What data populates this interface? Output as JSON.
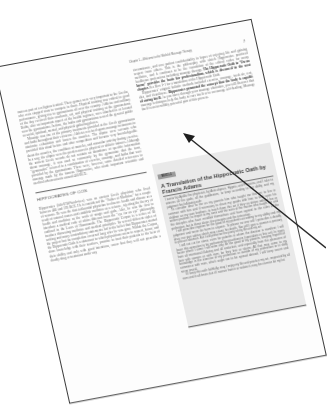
{
  "running_head": {
    "text": "Chapter 1—Welcome to the World of Massage Therapy",
    "page_number": "7"
  },
  "left_column": {
    "paragraphs": [
      "mass as part of a religious festival. These games were very important to the Greeks, who even stopped wars to compete in them. Physical training was critical to good performance, giving rise to gymnasiums all over the country. Athletes and military of the day received their academic, art, and physical training at the gymnasiums. Baths, also an important aspect of the health regimen, were attached to or located near the gymnasiums. In time, the baths and gymnasiums served the general public as social, spiritual, mental, and physical gathering places.",
      "Massage was one of the primary treatments provided at the Greek gymnasiums and baths throughout their existence. Athletes received sports massage treatments to minimize exhaustion and loosen the muscles. The aliptae were servants who provided this ritual before and after competition and became very knowledgeable about the muscles, the condition of muscles, and muscular activity during exercise. In a way, the aliptae were the predecessors to physical or athletic trainers. Although the ancient Greek records do not contain an abundance of specific information about massage, it was used so commonly by the gymnastae that the term, \"gymnastics\" referred to a combination of exercise, massage, and baths that were provided by the gymnasiums. There were, however, some detailed references to massage made by the famous Hippocrates, who made important scientific and medical advancements around 400 BCE."
    ],
    "bold_term": "gymnastics"
  },
  "section": {
    "heading": "HIPPOCRATES OF COS",
    "paragraph": "Hippocrates (hih-PAW-kruh-teez) was an ancient Greek physician who lived between 460 and 370 BCE. He is considered the \"Father of Medicine\" for a couple of reasons. He was the first influential physician to observe health and disease as a result of natural causes and establish medicine as a science, rejecting the theory of health and medicine as the work of magic and gods. Also, he was the first to introduce a medical code of ethics different from the \"eye for an eye\" philosophy outlined in the Laws of Hammurabi. The Hippocratic Corpus is a series of 60 treatises discussing medicine and medical principles. Its several different styles of writing and many contradictory statements led to the belief that Hippocrates started the project but its completion occurred long after he was gone. Within the Corpus, the Hippocratic Oath is a statement to which physicians swear to respect, honor, and share knowledge with their teachers, promise to treat their patients to the best of their ability and only with good intentions, swear that they will not prescribe a deadly drug or treatment under any"
  },
  "right_column": {
    "paragraph_1_pre": "circumstance, and vow patient confidentiality in hopes of enjoying life and gaining respect from others. This is the philosophy with which Hippocrates practiced medicine, and it continues to be the foundation of the ethical codes for many healthcare professions including massage therapy.",
    "paragraph_1_bold": "The Hippocratic Oath to \"Do no harm\" provides the basis for professionalism, which is discussed in the next chapter.",
    "paragraph_1_post": "See Box 1-1 for a translation of the Hippocratic Oath.",
    "paragraph_2_pre": "Hippocrates' original holistic methods included exercise, massage, fresh air, rest, diet, and cleanliness.",
    "paragraph_2_bold": "Hippocrates promoted the concept that the body is capable of curing itself.",
    "paragraph_2_post": "As you move through your massage education, you will discover that massage techniques help the body to cure itself or to encourage self-healing. Massage itself is an incredibly powerful part of this process."
  },
  "box": {
    "tab": "BOX 1-1",
    "title": "A Translation of the Hippocratic Oath by Francis Adams",
    "paragraphs": [
      "I swear by Apollo the physician, by Aesculapius, Hygeia, and Panacea, and I take to witness all the gods, all the goddesses, to keep according to my ability and my judgment the following oath:",
      "To consider dear to me as my parents him who taught me this art; to live in common with him and if necessary to share my goods with him; to look upon his children as my own brothers, to teach them this art if they so desire without fee or written promise; to impart to my sons and the sons of the master who taught me and the disciples who have enrolled themselves and have agreed to the rules of the profession, but to these alone, the precepts and the instruction.",
      "I will prescribe regimen for the good of my patients according to my ability and my judgment and never do harm to anyone. To please no one will I prescribe a deadly drug, nor give advice which may cause his death. Nor will I give a woman a pessary to procure abortion. But I will preserve the purity of my life and my art.",
      "I will not cut for stone, even for patients in whom the disease is manifest; I will leave this operation to be performed by practitioners (specialists in this art). In every house where I come I will enter only for the good of my patients, keeping myself far from all intentional ill-doing and all seduction, and especially from the pleasures of love with women or with men, be they free or slaves. All that may come to my knowledge in the exercise of my profession or outside of my profession or in daily commerce with men, which ought not to be spread abroad, I will keep secret and never reveal.",
      "If I keep this oath faithfully, may I enjoy my life and practice my art, respected by all men and in all times; but if I swerve from it or violate it, may the reverse be my lot."
    ]
  },
  "annotation": {
    "type": "arrow",
    "color": "#2a2a2a",
    "points_to": "capable of curing itself"
  }
}
